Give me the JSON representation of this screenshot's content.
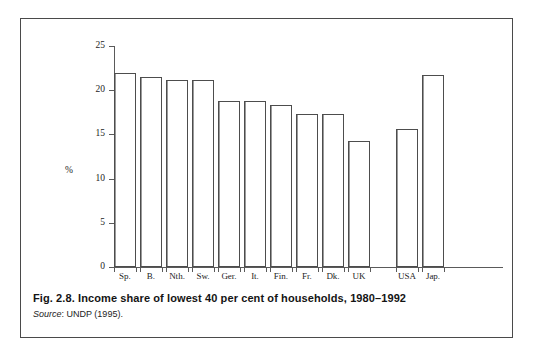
{
  "figure": {
    "caption_label": "Fig. 2.8.",
    "caption_title": "Income share of lowest 40 per cent of households, 1980–1992",
    "caption_full": "Fig. 2.8.  Income share of lowest 40 per cent of households, 1980–1992",
    "source_word": "Source",
    "source_rest": ": UNDP (1995).",
    "border_color": "#4a4a4a"
  },
  "axis": {
    "y_title": "%",
    "y_ticks": [
      "0",
      "5",
      "10",
      "15",
      "20",
      "25"
    ],
    "axis_color": "#5a5a5a"
  },
  "chart_data": {
    "type": "bar",
    "title": "Income share of lowest 40 per cent of households, 1980–1992",
    "xlabel": "",
    "ylabel": "%",
    "ylim": [
      0,
      25
    ],
    "yticks": [
      0,
      5,
      10,
      15,
      20,
      25
    ],
    "grid": false,
    "legend": "none",
    "source": "Source: UNDP (1995).",
    "categories": [
      "Sp.",
      "B.",
      "Nth.",
      "Sw.",
      "Ger.",
      "It.",
      "Fin.",
      "Fr.",
      "Dk.",
      "UK",
      "USA",
      "Jap."
    ],
    "values": [
      22.0,
      21.5,
      21.2,
      21.1,
      18.8,
      18.8,
      18.3,
      17.3,
      17.3,
      14.3,
      15.6,
      21.7
    ],
    "group_break_after": "UK",
    "bar_style": {
      "fill": "#ffffff",
      "edge": "#4d4d4d"
    }
  }
}
